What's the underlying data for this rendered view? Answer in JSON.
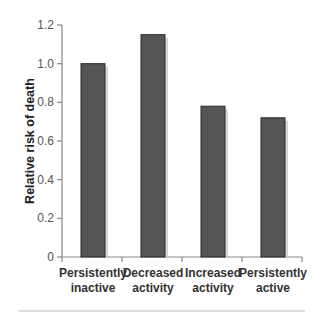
{
  "chart_data": {
    "type": "bar",
    "title": "",
    "xlabel": "",
    "ylabel": "Relative risk of death",
    "categories": [
      [
        "Persistently",
        "inactive"
      ],
      [
        "Decreased",
        "activity"
      ],
      [
        "Increased",
        "activity"
      ],
      [
        "Persistently",
        "active"
      ]
    ],
    "category_names": [
      "Persistently inactive",
      "Decreased activity",
      "Increased activity",
      "Persistently active"
    ],
    "values": [
      1.0,
      1.15,
      0.78,
      0.72
    ],
    "ylim": [
      0,
      1.2
    ],
    "yticks": [
      0,
      0.2,
      0.4,
      0.6,
      0.8,
      1.0,
      1.2
    ],
    "ytick_labels": [
      "0",
      "0.2",
      "0.4",
      "0.6",
      "0.8",
      "1.0",
      "1.2"
    ],
    "grid": false,
    "legend": null,
    "colors": {
      "bar": "#555555",
      "bar_edge": "#2a2a2a",
      "bar_shadow": "#c8c8c8",
      "axis": "#888888",
      "rule": "#bbbbbb"
    }
  }
}
